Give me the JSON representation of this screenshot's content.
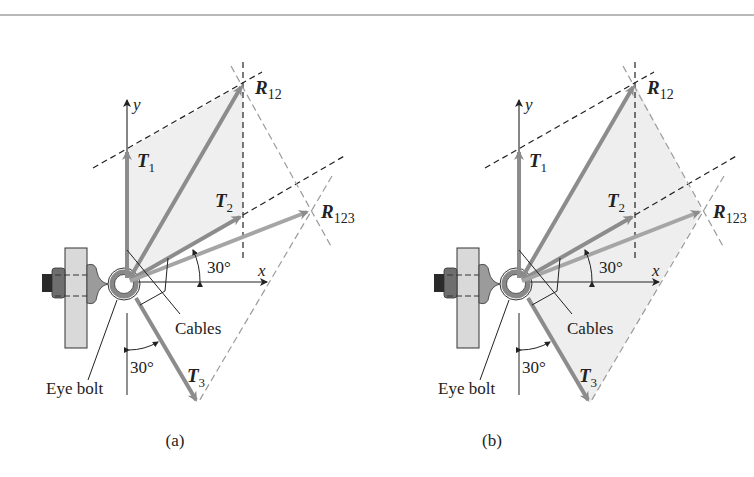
{
  "figure": {
    "panels": [
      {
        "id": "a",
        "caption": "(a)",
        "shaded_region": "parallelogram T1-R12-T2",
        "labels": {
          "y_axis": "y",
          "x_axis": "x",
          "T1": "T",
          "T1_sub": "1",
          "T2": "T",
          "T2_sub": "2",
          "T3": "T",
          "T3_sub": "3",
          "R12": "R",
          "R12_sub": "12",
          "R123": "R",
          "R123_sub": "123",
          "angle_top": "30°",
          "angle_bottom": "30°",
          "cables": "Cables",
          "eye_bolt": "Eye bolt"
        }
      },
      {
        "id": "b",
        "caption": "(b)",
        "shaded_region": "triangle O-R12-R123-T3",
        "labels": {
          "y_axis": "y",
          "x_axis": "x",
          "T1": "T",
          "T1_sub": "1",
          "T2": "T",
          "T2_sub": "2",
          "T3": "T",
          "T3_sub": "3",
          "R12": "R",
          "R12_sub": "12",
          "R123": "R",
          "R123_sub": "123",
          "angle_top": "30°",
          "angle_bottom": "30°",
          "cables": "Cables",
          "eye_bolt": "Eye bolt"
        }
      }
    ],
    "colors": {
      "vector": "#8c8c8c",
      "shade": "#eeeeee",
      "dash_dark": "#222222",
      "dash_light": "#9a9a9a",
      "plate": "#d9d9d9",
      "nut": "#6e6e6e"
    }
  }
}
